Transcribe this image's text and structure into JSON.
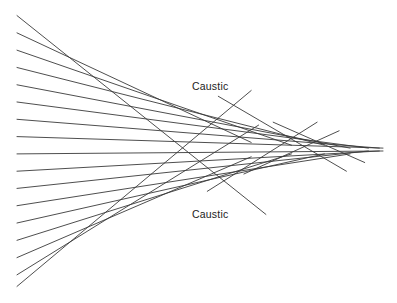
{
  "diagram": {
    "labels": {
      "upper": "Caustic",
      "lower": "Caustic"
    },
    "line_color": "#3a3a3a",
    "rays_upper": [
      {
        "y0": -47,
        "x1": 68,
        "y1": 22
      },
      {
        "y0": -41,
        "x1": 64,
        "y1": -3
      },
      {
        "y0": -35,
        "x1": 75,
        "y1": -2
      },
      {
        "y0": -29,
        "x1": 84,
        "y1": -2
      },
      {
        "y0": -23,
        "x1": 91,
        "y1": -1
      },
      {
        "y0": -17,
        "x1": 96,
        "y1": -1
      },
      {
        "y0": -11,
        "x1": 99,
        "y1": -1
      },
      {
        "y0": -5,
        "x1": 100,
        "y1": -1
      }
    ],
    "rays_lower": [
      {
        "y0": 1,
        "x1": 100,
        "y1": 0
      },
      {
        "y0": 7,
        "x1": 99,
        "y1": 0
      },
      {
        "y0": 13,
        "x1": 96,
        "y1": 0
      },
      {
        "y0": 19,
        "x1": 91,
        "y1": 1
      },
      {
        "y0": 25,
        "x1": 84,
        "y1": 1
      },
      {
        "y0": 31,
        "x1": 75,
        "y1": 1
      },
      {
        "y0": 37,
        "x1": 64,
        "y1": 2
      },
      {
        "y0": 43,
        "x1": 66,
        "y1": -9
      },
      {
        "y0": 47,
        "x1": 64,
        "y1": -21
      }
    ],
    "crossing_rays": [
      {
        "x0": 55,
        "y0": -19,
        "x1": 90,
        "y1": 7
      },
      {
        "x0": 70,
        "y0": -10,
        "x1": 95,
        "y1": 4
      },
      {
        "x0": 52,
        "y0": 14,
        "x1": 82,
        "y1": -10
      },
      {
        "x0": 62,
        "y0": 8,
        "x1": 88,
        "y1": -7
      }
    ]
  }
}
